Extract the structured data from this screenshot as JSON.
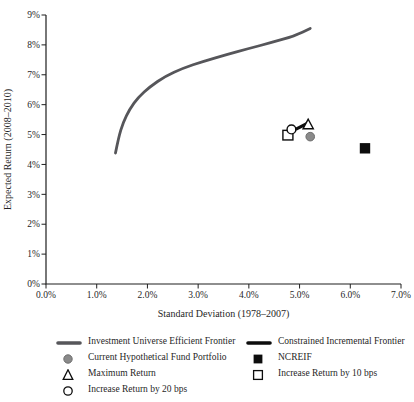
{
  "figure": {
    "background": "#ffffff",
    "ink_color": "#1f1f1f"
  },
  "chart_data": {
    "type": "scatter",
    "title": "",
    "xlabel": "Standard Deviation (1978–2007)",
    "ylabel": "Expected Return (2008–2010)",
    "xlim": [
      0,
      7
    ],
    "ylim": [
      0,
      9
    ],
    "grid": false,
    "legend_position": "bottom-two-columns",
    "x_ticks": [
      {
        "v": 0,
        "label": "0.0%"
      },
      {
        "v": 1,
        "label": "1.0%"
      },
      {
        "v": 2,
        "label": "2.0%"
      },
      {
        "v": 3,
        "label": "3.0%"
      },
      {
        "v": 4,
        "label": "4.0%"
      },
      {
        "v": 5,
        "label": "5.0%"
      },
      {
        "v": 6,
        "label": "6.0%"
      },
      {
        "v": 7,
        "label": "7.0%"
      }
    ],
    "y_ticks": [
      {
        "v": 0,
        "label": "0%"
      },
      {
        "v": 1,
        "label": "1%"
      },
      {
        "v": 2,
        "label": "2%"
      },
      {
        "v": 3,
        "label": "3%"
      },
      {
        "v": 4,
        "label": "4%"
      },
      {
        "v": 5,
        "label": "5%"
      },
      {
        "v": 6,
        "label": "6%"
      },
      {
        "v": 7,
        "label": "7%"
      },
      {
        "v": 8,
        "label": "8%"
      },
      {
        "v": 9,
        "label": "9%"
      }
    ],
    "series": [
      {
        "name": "Investment Universe Efficient Frontier",
        "type": "line",
        "color": "#56565a",
        "stroke_width": 2.8,
        "z": 1,
        "points": [
          [
            1.37,
            4.38
          ],
          [
            1.43,
            4.9
          ],
          [
            1.52,
            5.4
          ],
          [
            1.65,
            5.85
          ],
          [
            1.82,
            6.25
          ],
          [
            2.05,
            6.6
          ],
          [
            2.35,
            6.95
          ],
          [
            2.7,
            7.22
          ],
          [
            3.1,
            7.45
          ],
          [
            3.55,
            7.67
          ],
          [
            4.0,
            7.88
          ],
          [
            4.45,
            8.08
          ],
          [
            4.9,
            8.3
          ],
          [
            5.21,
            8.55
          ]
        ]
      },
      {
        "name": "Constrained Incremental Frontier",
        "type": "line",
        "color": "#0d0d0d",
        "stroke_width": 3.2,
        "z": 4,
        "points": [
          [
            4.94,
            5.19
          ],
          [
            5.15,
            5.37
          ]
        ]
      }
    ],
    "markers": [
      {
        "name": "Increase Return by 10 bps",
        "shape": "open-square",
        "x": 4.77,
        "y": 4.98,
        "color": "#0d0d0d",
        "z": 2
      },
      {
        "name": "Increase Return by 20 bps",
        "shape": "open-circle",
        "x": 4.84,
        "y": 5.17,
        "color": "#0d0d0d",
        "z": 3
      },
      {
        "name": "Maximum Return",
        "shape": "open-triangle",
        "x": 5.17,
        "y": 5.32,
        "color": "#0d0d0d",
        "z": 5
      },
      {
        "name": "Current Hypothetical Fund Portfolio",
        "shape": "filled-circle",
        "x": 5.21,
        "y": 4.93,
        "color": "#8a8a8a",
        "z": 6
      },
      {
        "name": "NCREIF",
        "shape": "filled-square",
        "x": 6.29,
        "y": 4.54,
        "color": "#0d0d0d",
        "z": 7
      }
    ],
    "legend": {
      "columns": [
        [
          {
            "symbol": "thick-line",
            "color": "#56565a",
            "label": "Investment Universe Efficient Frontier"
          },
          {
            "symbol": "filled-circle",
            "color": "#8a8a8a",
            "label": "Current Hypothetical Fund Portfolio"
          },
          {
            "symbol": "open-triangle",
            "color": "#0d0d0d",
            "label": "Maximum Return"
          },
          {
            "symbol": "open-circle",
            "color": "#0d0d0d",
            "label": "Increase Return by 20 bps"
          }
        ],
        [
          {
            "symbol": "thick-line",
            "color": "#0d0d0d",
            "label": "Constrained Incremental Frontier"
          },
          {
            "symbol": "filled-square",
            "color": "#0d0d0d",
            "label": "NCREIF"
          },
          {
            "symbol": "open-square",
            "color": "#0d0d0d",
            "label": "Increase Return by 10 bps"
          }
        ]
      ]
    }
  }
}
